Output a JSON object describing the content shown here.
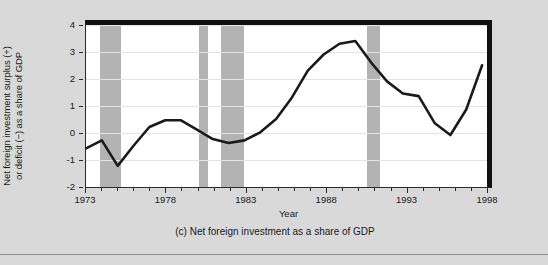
{
  "figure": {
    "caption": "(c) Net foreign investment as a share of GDP",
    "background_color": "#d9d9d9",
    "plot_background_color": "#ffffff",
    "band_color": "#b3b3b3",
    "line_color": "#1a1a1a",
    "frame_color": "#111111"
  },
  "chart_data": {
    "type": "line",
    "title": "(c) Net foreign investment as a share of GDP",
    "xlabel": "Year",
    "ylabel": "Net foreign investment surplus (+) or deficit (−) as a share of GDP",
    "ylabel_line1": "Net foreign investment surplus (+)",
    "ylabel_line2": "or deficit (−) as a share of GDP",
    "xlim": [
      1973,
      1998
    ],
    "ylim": [
      -2,
      4
    ],
    "yticks": [
      4,
      3,
      2,
      1,
      0,
      -1,
      -2
    ],
    "ytick_labels": [
      "4",
      "3",
      "2",
      "1",
      "0",
      "-1",
      "-2"
    ],
    "xticks_major": [
      1973,
      1978,
      1983,
      1988,
      1993,
      1998
    ],
    "xtick_labels": [
      "1973",
      "1978",
      "1983",
      "1988",
      "1993",
      "1998"
    ],
    "xticks_minor_step": 1,
    "grid": "horizontal",
    "legend": "none",
    "series": [
      {
        "name": "Net foreign investment as a share of GDP",
        "x": [
          1973.0,
          1974.0,
          1975.0,
          1976.0,
          1977.0,
          1978.0,
          1979.0,
          1980.0,
          1981.0,
          1982.0,
          1983.0,
          1984.0,
          1985.0,
          1986.0,
          1987.0,
          1988.0,
          1989.0,
          1990.0,
          1991.0,
          1992.0,
          1993.0,
          1994.0,
          1995.0,
          1996.0,
          1997.0,
          1998.0
        ],
        "values": [
          -0.6,
          -0.3,
          -1.25,
          -0.5,
          0.2,
          0.45,
          0.45,
          0.1,
          -0.25,
          -0.4,
          -0.3,
          0.0,
          0.5,
          1.3,
          2.3,
          2.9,
          3.3,
          3.4,
          2.6,
          1.9,
          1.45,
          1.35,
          0.35,
          -0.1,
          0.85,
          2.5
        ]
      }
    ],
    "shaded_regions": [
      {
        "label": "recession",
        "start": 1973.9,
        "end": 1975.2
      },
      {
        "label": "recession",
        "start": 1980.0,
        "end": 1980.6
      },
      {
        "label": "recession",
        "start": 1981.4,
        "end": 1982.8
      },
      {
        "label": "recession",
        "start": 1990.5,
        "end": 1991.3
      }
    ]
  }
}
